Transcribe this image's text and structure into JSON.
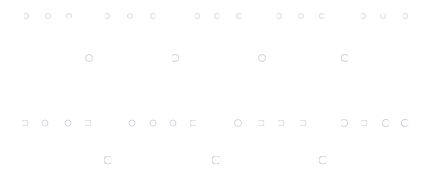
{
  "canvas": {
    "width": 432,
    "height": 185,
    "background_color": "#ffffff",
    "glyph_color": "#c9c9cf",
    "glyph_name": "small-circle-glyph",
    "description": "Sparse field of faint light-gray small ring glyphs arranged in four staggered horizontal rows"
  },
  "chart_data": {
    "type": "scatter",
    "title": "",
    "subtitle": "",
    "xlabel": "",
    "ylabel": "",
    "xlim": [
      0,
      432
    ],
    "ylim": [
      0,
      185
    ],
    "grid": false,
    "legend": "none",
    "marker": "open-circle",
    "marker_color": "#c9c9cf",
    "series": [
      {
        "name": "row-1",
        "y": 16,
        "x": [
          26,
          48,
          69,
          107,
          130,
          153,
          197,
          217,
          239,
          279,
          301,
          322,
          363,
          383,
          405
        ],
        "count": 15
      },
      {
        "name": "row-2",
        "y": 58,
        "x": [
          89,
          175,
          262,
          345
        ],
        "count": 4
      },
      {
        "name": "row-3",
        "y": 123,
        "x": [
          25,
          45,
          68,
          88,
          132,
          153,
          173,
          193,
          238,
          261,
          281,
          303,
          344,
          364,
          386,
          405
        ],
        "count": 16
      },
      {
        "name": "row-4",
        "y": 160,
        "x": [
          108,
          216,
          323
        ],
        "count": 3
      }
    ],
    "total_points": 38
  },
  "points": {
    "row1": [
      {
        "x": 26,
        "y": 16,
        "size": "s1",
        "style": "open-left"
      },
      {
        "x": 48,
        "y": 16,
        "size": "s1",
        "style": ""
      },
      {
        "x": 69,
        "y": 16,
        "size": "s1",
        "style": "open-bot"
      },
      {
        "x": 107,
        "y": 16,
        "size": "s1",
        "style": "open-left"
      },
      {
        "x": 130,
        "y": 16,
        "size": "s1",
        "style": ""
      },
      {
        "x": 153,
        "y": 16,
        "size": "s1",
        "style": "open-right"
      },
      {
        "x": 197,
        "y": 16,
        "size": "s1",
        "style": "open-left"
      },
      {
        "x": 217,
        "y": 16,
        "size": "s1",
        "style": "open-right"
      },
      {
        "x": 239,
        "y": 16,
        "size": "s1",
        "style": "open-right"
      },
      {
        "x": 279,
        "y": 16,
        "size": "s1",
        "style": "open-left"
      },
      {
        "x": 301,
        "y": 16,
        "size": "s1",
        "style": ""
      },
      {
        "x": 322,
        "y": 16,
        "size": "s1",
        "style": "open-right"
      },
      {
        "x": 363,
        "y": 16,
        "size": "s1",
        "style": "open-left"
      },
      {
        "x": 383,
        "y": 16,
        "size": "s1",
        "style": "open-top"
      },
      {
        "x": 405,
        "y": 16,
        "size": "s1",
        "style": "open-left"
      }
    ],
    "row2": [
      {
        "x": 89,
        "y": 58,
        "size": "s3",
        "style": ""
      },
      {
        "x": 175,
        "y": 58,
        "size": "s3",
        "style": "open-left"
      },
      {
        "x": 262,
        "y": 58,
        "size": "s3",
        "style": ""
      },
      {
        "x": 345,
        "y": 58,
        "size": "s3",
        "style": "open-right"
      }
    ],
    "row3": [
      {
        "x": 25,
        "y": 123,
        "size": "s2",
        "style": "open-left"
      },
      {
        "x": 45,
        "y": 123,
        "size": "s2",
        "style": ""
      },
      {
        "x": 68,
        "y": 123,
        "size": "s2",
        "style": ""
      },
      {
        "x": 88,
        "y": 123,
        "size": "s2",
        "style": "open-left"
      },
      {
        "x": 132,
        "y": 123,
        "size": "s2",
        "style": ""
      },
      {
        "x": 153,
        "y": 123,
        "size": "s2",
        "style": ""
      },
      {
        "x": 173,
        "y": 123,
        "size": "s2",
        "style": ""
      },
      {
        "x": 193,
        "y": 123,
        "size": "s2",
        "style": "open-right"
      },
      {
        "x": 238,
        "y": 123,
        "size": "s3",
        "style": ""
      },
      {
        "x": 261,
        "y": 123,
        "size": "s2",
        "style": "open-left"
      },
      {
        "x": 281,
        "y": 123,
        "size": "s2",
        "style": "open-left"
      },
      {
        "x": 303,
        "y": 123,
        "size": "s2",
        "style": "open-left"
      },
      {
        "x": 344,
        "y": 123,
        "size": "s3",
        "style": "open-left"
      },
      {
        "x": 364,
        "y": 123,
        "size": "s2",
        "style": "open-left"
      },
      {
        "x": 386,
        "y": 123,
        "size": "s3",
        "style": "open-right"
      },
      {
        "x": 405,
        "y": 123,
        "size": "s3",
        "style": "open-right"
      }
    ],
    "row4": [
      {
        "x": 108,
        "y": 160,
        "size": "s4",
        "style": "open-right"
      },
      {
        "x": 216,
        "y": 160,
        "size": "s4",
        "style": "open-right"
      },
      {
        "x": 323,
        "y": 160,
        "size": "s4",
        "style": "open-right"
      }
    ]
  }
}
